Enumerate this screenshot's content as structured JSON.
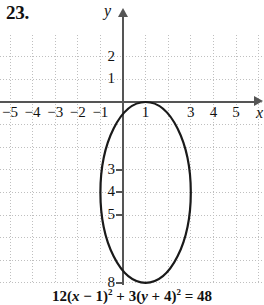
{
  "problem": {
    "number": "23."
  },
  "chart_data": {
    "type": "line",
    "title": "",
    "equation": {
      "coef_x": "12",
      "x_var": "x",
      "x_shift": "− 1",
      "coef_y": "3",
      "y_var": "y",
      "y_shift": "+ 4",
      "rhs": "48",
      "full": "12(x − 1)² + 3(y + 4)² = 48"
    },
    "curve": {
      "shape": "ellipse",
      "center": [
        1,
        -4
      ],
      "semi_axis_x": 2,
      "semi_axis_y": 4,
      "x_range": [
        -1,
        3
      ],
      "y_range": [
        -8,
        0
      ],
      "stroke": "#1a1a1a",
      "stroke_width": 2.2
    },
    "xlabel": "x",
    "ylabel": "y",
    "xlim": [
      -5.6,
      6.2
    ],
    "ylim": [
      -9.6,
      3.2
    ],
    "grid": true,
    "grid_style": "dotted",
    "grid_color": "#bfbfbf",
    "axis_color": "#555555",
    "x_ticks": [
      {
        "value": -5,
        "label": "−5"
      },
      {
        "value": -4,
        "label": "−4"
      },
      {
        "value": -3,
        "label": "−3"
      },
      {
        "value": -2,
        "label": "−2"
      },
      {
        "value": -1,
        "label": "−1"
      },
      {
        "value": 1,
        "label": "1"
      },
      {
        "value": 3,
        "label": "3"
      },
      {
        "value": 4,
        "label": "4"
      },
      {
        "value": 5,
        "label": "5"
      }
    ],
    "y_ticks": [
      {
        "value": 2,
        "label": "2"
      },
      {
        "value": 1,
        "label": "1"
      },
      {
        "value": -3,
        "label": "3"
      },
      {
        "value": -4,
        "label": "4"
      },
      {
        "value": -5,
        "label": "5"
      },
      {
        "value": -8,
        "label": "8"
      }
    ],
    "y_tick_prefix": "−",
    "legend": null
  }
}
